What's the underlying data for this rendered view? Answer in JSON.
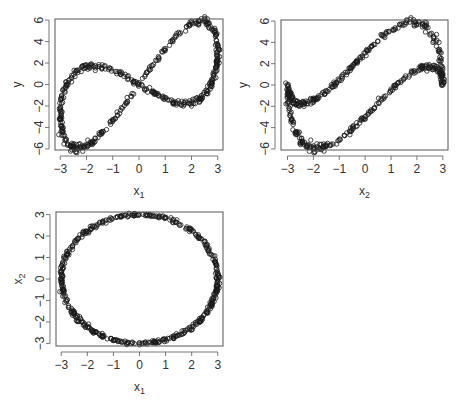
{
  "figure": {
    "layout": "2x2 grid of scatterplots, bottom-right panel empty",
    "background": "#ffffff",
    "point_color": "#1a1a1a",
    "axis_color": "#555555"
  },
  "chart_data": [
    {
      "id": "panel-y-vs-x1",
      "type": "scatter",
      "title": "",
      "xlabel": "x",
      "xlabel_sub": "1",
      "ylabel": "y",
      "xlim": [
        -3.2,
        3.2
      ],
      "ylim": [
        -6.1,
        6.1
      ],
      "xticks": [
        -3,
        -2,
        -1,
        0,
        1,
        2,
        3
      ],
      "xtick_labels": [
        "-3",
        "-2",
        "-1",
        "0",
        "1",
        "2",
        "3"
      ],
      "yticks": [
        -6,
        -4,
        -2,
        0,
        2,
        4,
        6
      ],
      "ytick_labels": [
        "-6",
        "-4",
        "-2",
        "0",
        "2",
        "4",
        "6"
      ],
      "grid": false,
      "marker": "open-circle",
      "box": {
        "left": 55,
        "top": 19,
        "right": 223,
        "bottom": 150
      },
      "x_var": "x1",
      "y_var": "y"
    },
    {
      "id": "panel-y-vs-x2",
      "type": "scatter",
      "title": "",
      "xlabel": "x",
      "xlabel_sub": "2",
      "ylabel": "y",
      "xlim": [
        -3.25,
        3.2
      ],
      "ylim": [
        -6.1,
        6.1
      ],
      "xticks": [
        -3,
        -2,
        -1,
        0,
        1,
        2,
        3
      ],
      "xtick_labels": [
        "-3",
        "-2",
        "-1",
        "0",
        "1",
        "2",
        "3"
      ],
      "yticks": [
        -6,
        -4,
        -2,
        0,
        2,
        4,
        6
      ],
      "ytick_labels": [
        "-6",
        "-4",
        "-2",
        "0",
        "2",
        "4",
        "6"
      ],
      "grid": false,
      "marker": "open-circle",
      "box": {
        "left": 281,
        "top": 20,
        "right": 448,
        "bottom": 150
      },
      "x_var": "x2",
      "y_var": "y"
    },
    {
      "id": "panel-x2-vs-x1",
      "type": "scatter",
      "title": "",
      "xlabel": "x",
      "xlabel_sub": "1",
      "ylabel": "x",
      "ylabel_sub": "2",
      "xlim": [
        -3.2,
        3.2
      ],
      "ylim": [
        -3.12,
        3.12
      ],
      "xticks": [
        -3,
        -2,
        -1,
        0,
        1,
        2,
        3
      ],
      "xtick_labels": [
        "-3",
        "-2",
        "-1",
        "0",
        "1",
        "2",
        "3"
      ],
      "yticks": [
        -3,
        -2,
        -1,
        0,
        1,
        2,
        3
      ],
      "ytick_labels": [
        "-3",
        "-2",
        "-1",
        "0",
        "1",
        "2",
        "3"
      ],
      "grid": false,
      "marker": "open-circle",
      "box": {
        "left": 56,
        "top": 212,
        "right": 223,
        "bottom": 346
      },
      "x_var": "x1",
      "y_var": "x2"
    }
  ],
  "data_description": {
    "n_points_approx": 500,
    "x1": "3*cos(t)",
    "x2": "3*sin(t)",
    "y": "x1 + 2.47*x2*|x1|/3 (approx.)",
    "sample_points": [
      {
        "x1": 3.0,
        "x2": 0.0,
        "y": 3.0
      },
      {
        "x1": 2.65,
        "x2": 1.4,
        "y": 5.7
      },
      {
        "x1": 0.0,
        "x2": 3.0,
        "y": 0.0
      },
      {
        "x1": -2.57,
        "x2": 1.55,
        "y": 0.7
      },
      {
        "x1": -3.0,
        "x2": 0.0,
        "y": -3.0
      },
      {
        "x1": -2.7,
        "x2": -1.3,
        "y": -5.7
      },
      {
        "x1": 0.0,
        "x2": -3.0,
        "y": 0.0
      },
      {
        "x1": 2.65,
        "x2": -1.4,
        "y": -0.3
      }
    ]
  }
}
